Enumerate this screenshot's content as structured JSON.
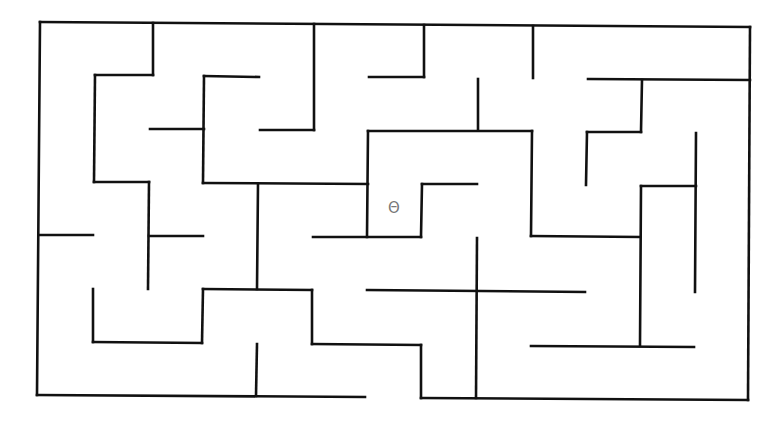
{
  "maze": {
    "wall_color": "#111111",
    "wall_width": 2.6,
    "marker": {
      "symbol": "Θ",
      "x": 395,
      "y": 209,
      "color": "#777777"
    },
    "walls": [
      [
        40,
        22,
        750,
        27
      ],
      [
        40,
        22,
        37,
        395
      ],
      [
        750,
        27,
        748,
        400
      ],
      [
        37,
        395,
        365,
        397
      ],
      [
        421,
        398,
        748,
        400
      ],
      [
        153,
        23,
        153,
        75
      ],
      [
        95,
        75,
        153,
        75
      ],
      [
        95,
        75,
        94,
        182
      ],
      [
        94,
        182,
        149,
        182
      ],
      [
        149,
        182,
        148,
        289
      ],
      [
        150,
        129,
        204,
        129
      ],
      [
        204,
        76,
        259,
        77
      ],
      [
        204,
        76,
        203,
        183
      ],
      [
        203,
        183,
        368,
        184
      ],
      [
        314,
        24,
        314,
        130
      ],
      [
        260,
        130,
        314,
        130
      ],
      [
        368,
        131,
        532,
        131
      ],
      [
        368,
        131,
        367,
        237
      ],
      [
        258,
        184,
        257,
        289
      ],
      [
        424,
        25,
        424,
        77
      ],
      [
        369,
        77,
        424,
        77
      ],
      [
        533,
        26,
        533,
        78
      ],
      [
        478,
        79,
        478,
        130
      ],
      [
        532,
        131,
        531,
        236
      ],
      [
        531,
        236,
        640,
        237
      ],
      [
        588,
        79,
        750,
        80
      ],
      [
        642,
        80,
        641,
        132
      ],
      [
        587,
        132,
        641,
        132
      ],
      [
        587,
        132,
        586,
        185
      ],
      [
        422,
        184,
        477,
        184
      ],
      [
        422,
        184,
        421,
        237
      ],
      [
        313,
        237,
        421,
        237
      ],
      [
        696,
        133,
        695,
        292
      ],
      [
        641,
        186,
        696,
        186
      ],
      [
        641,
        186,
        640,
        345
      ],
      [
        40,
        235,
        93,
        235
      ],
      [
        149,
        236,
        203,
        236
      ],
      [
        93,
        289,
        93,
        342
      ],
      [
        93,
        342,
        202,
        343
      ],
      [
        202,
        343,
        203,
        289
      ],
      [
        203,
        289,
        312,
        290
      ],
      [
        312,
        290,
        312,
        344
      ],
      [
        312,
        344,
        421,
        345
      ],
      [
        421,
        345,
        421,
        398
      ],
      [
        257,
        344,
        256,
        396
      ],
      [
        367,
        290,
        585,
        292
      ],
      [
        477,
        238,
        476,
        398
      ],
      [
        531,
        346,
        694,
        347
      ]
    ]
  }
}
